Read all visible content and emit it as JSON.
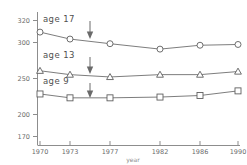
{
  "chart_data": {
    "type": "line",
    "title": "",
    "xlabel": "year",
    "ylabel": "",
    "x": [
      1970,
      1973,
      1977,
      1982,
      1986,
      1990
    ],
    "xtick_labels": [
      "1970",
      "1973",
      "1977",
      "1982",
      "1986",
      "1990"
    ],
    "ytick_labels": [
      "170",
      "200",
      "250",
      "300",
      "320"
    ],
    "yticks": [
      170,
      200,
      250,
      300,
      320
    ],
    "ylim": [
      170,
      320
    ],
    "xlim": [
      1970,
      1990
    ],
    "grid": false,
    "legend_position": "inline-annotations",
    "series": [
      {
        "name": "age 17",
        "label": "age 17",
        "marker": "circle",
        "values": [
          305,
          296,
          290,
          283,
          288,
          289
        ]
      },
      {
        "name": "age 13",
        "label": "age 13",
        "marker": "triangle",
        "values": [
          255,
          250,
          247,
          250,
          250,
          254
        ]
      },
      {
        "name": "age 9",
        "label": "age 9",
        "marker": "square",
        "values": [
          225,
          220,
          220,
          221,
          223,
          229
        ]
      }
    ],
    "annotations": [
      {
        "type": "arrow",
        "direction": "down",
        "points_to": "age 17",
        "at_x": 1975.5
      },
      {
        "type": "arrow",
        "direction": "down",
        "points_to": "age 13",
        "at_x": 1975.5
      },
      {
        "type": "arrow",
        "direction": "down",
        "points_to": "age 9",
        "at_x": 1975.5
      }
    ]
  },
  "labels": {
    "age17": "age 17",
    "age13": "age 13",
    "age9": "age 9",
    "xaxis": "year",
    "y_320": "320",
    "y_300": "300",
    "y_250": "250",
    "y_200": "200",
    "y_170": "170",
    "x_1970": "1970",
    "x_1973": "1973",
    "x_1977": "1977",
    "x_1982": "1982",
    "x_1986": "1986",
    "x_1990": "1990"
  },
  "colors": {
    "line": "#6e6e6e",
    "axis": "#8d8d8d",
    "text": "#5a5a5a",
    "background": "#ffffff"
  }
}
